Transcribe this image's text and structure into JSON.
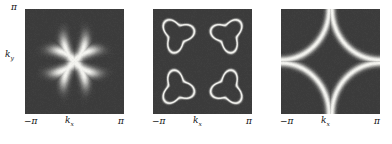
{
  "figure": {
    "background": "#ffffff",
    "panel_background": "#3b3b3b",
    "feature_color": "#f2f2ee",
    "panel_count": 3
  },
  "axes": {
    "x_tick_min": "−π",
    "x_tick_max": "π",
    "x_label_main": "k",
    "x_label_sub": "x",
    "y_tick_max": "π",
    "y_label_main": "k",
    "y_label_sub": "y"
  },
  "panels": [
    {
      "id": "panel-a",
      "x_tick_min": "−π",
      "x_tick_max": "π",
      "x_label_main": "k",
      "x_label_sub": "x",
      "y_tick_max": "π",
      "y_label_main": "k",
      "y_label_sub": "y",
      "show_y_axis": true
    },
    {
      "id": "panel-b",
      "x_tick_min": "−π",
      "x_tick_max": "π",
      "x_label_main": "k",
      "x_label_sub": "x",
      "show_y_axis": false
    },
    {
      "id": "panel-c",
      "x_tick_min": "−π",
      "x_tick_max": "π",
      "x_label_main": "k",
      "x_label_sub": "x",
      "show_y_axis": false
    }
  ],
  "chart_data": {
    "type": "heatmap",
    "title": "",
    "xlabel": "k_x",
    "ylabel": "k_y",
    "xlim": [
      -3.14159,
      3.14159
    ],
    "ylim": [
      -3.14159,
      3.14159
    ],
    "xtick_labels": [
      "−π",
      "π"
    ],
    "ytick_labels": [
      "π"
    ],
    "grid": false,
    "legend": "none",
    "colormap": {
      "low": "#3b3b3b",
      "high": "#f4f4f0",
      "description": "grayscale spectral intensity, dark background bright features"
    },
    "panels": [
      {
        "name": "panel-a",
        "description": "Four elongated bright diagonal arcs (Fermi arcs) centred near the Brillouin-zone diagonals, thick and blurred",
        "feature": "arcs",
        "arc_centers_k": [
          [
            -1.55,
            1.55
          ],
          [
            1.55,
            1.55
          ],
          [
            -1.55,
            -1.55
          ],
          [
            1.55,
            -1.55
          ]
        ],
        "arc_radius_k": 2.25,
        "arc_half_span_deg": 26,
        "arc_thickness_k": 0.42,
        "peak_intensity": 1.0,
        "background_intensity": 0.12
      },
      {
        "name": "panel-b",
        "description": "Four thin closed rounded-triangular hole pockets near the zone diagonals",
        "feature": "closed-pockets",
        "pocket_centers_k": [
          [
            -1.6,
            1.6
          ],
          [
            1.6,
            1.6
          ],
          [
            -1.6,
            -1.6
          ],
          [
            1.6,
            -1.6
          ]
        ],
        "pocket_radius_k": 0.85,
        "pocket_thickness_k": 0.13,
        "peak_intensity": 1.0,
        "background_intensity": 0.12
      },
      {
        "name": "panel-c",
        "description": "Continuous large Fermi surface contour: four concave arcs from the zone corners enclosing a diamond shaped region around the zone centre",
        "feature": "continuous-contour",
        "arc_centers_k": [
          [
            -3.14159,
            3.14159
          ],
          [
            3.14159,
            3.14159
          ],
          [
            -3.14159,
            -3.14159
          ],
          [
            3.14159,
            -3.14159
          ]
        ],
        "arc_radius_k": 3.05,
        "arc_thickness_k": 0.3,
        "peak_intensity": 1.0,
        "background_intensity": 0.12
      }
    ]
  }
}
